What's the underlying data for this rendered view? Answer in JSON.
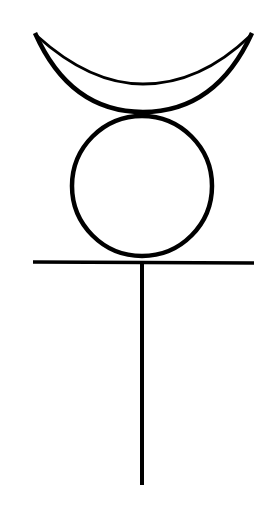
{
  "symbol": {
    "name": "Mercury symbol",
    "stroke_color": "#000000",
    "background": "#ffffff",
    "parts": {
      "crescent": {
        "left_tip": [
          35,
          33
        ],
        "right_tip": [
          252,
          33
        ]
      },
      "circle": {
        "cx": 142,
        "cy": 186,
        "r": 70
      },
      "crossbar": {
        "x1": 33,
        "x2": 254,
        "y": 262
      },
      "stem": {
        "x": 142,
        "y1": 262,
        "y2": 485
      }
    }
  }
}
